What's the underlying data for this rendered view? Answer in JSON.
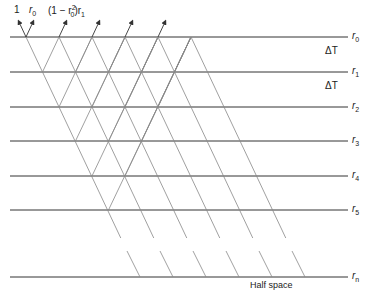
{
  "diagram": {
    "type": "layered-media-reflection-lattice",
    "top_labels": {
      "incident": "1",
      "reflect_r": "r",
      "reflect_sub": "0",
      "transmit_prefix": "(1 − r",
      "transmit_sub": "0",
      "transmit_sup": "2",
      "transmit_suffix": ")r",
      "transmit_sub2": "1"
    },
    "layers": [
      {
        "y": 37,
        "label": "r",
        "sub": "0"
      },
      {
        "y": 72,
        "label": "r",
        "sub": "1"
      },
      {
        "y": 107,
        "label": "r",
        "sub": "2"
      },
      {
        "y": 141,
        "label": "r",
        "sub": "3"
      },
      {
        "y": 176,
        "label": "r",
        "sub": "4"
      },
      {
        "y": 210,
        "label": "r",
        "sub": "5"
      }
    ],
    "bottom_layer": {
      "y": 277,
      "label": "r",
      "sub": "n"
    },
    "interval_labels": [
      {
        "text": "ΔT",
        "y": 50
      },
      {
        "text": "ΔT",
        "y": 85
      }
    ],
    "half_space_label": "Half space",
    "colors": {
      "line": "#333333",
      "lattice": "#777777",
      "text": "#222222"
    }
  }
}
